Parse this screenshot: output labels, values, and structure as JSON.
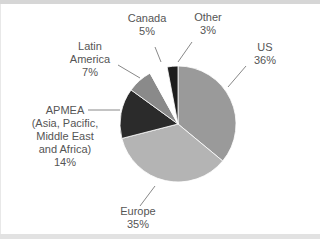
{
  "chart_data": {
    "type": "pie",
    "title": "",
    "labels": [
      "US",
      "Europe",
      "APMEA (Asia, Pacific, Middle East and Africa)",
      "Latin America",
      "Canada",
      "Other"
    ],
    "values": [
      36,
      35,
      14,
      7,
      5,
      3
    ],
    "colors": [
      "#9a9a9a",
      "#b4b4b4",
      "#2b2b2b",
      "#8a8a8a",
      "#ffffff",
      "#1e1e1e"
    ],
    "unit": "%"
  },
  "labels": {
    "us": {
      "name": "US",
      "pct": "36%"
    },
    "europe": {
      "name": "Europe",
      "pct": "35%"
    },
    "apmea": {
      "line1": "APMEA",
      "line2": "(Asia, Pacific,",
      "line3": "Middle East",
      "line4": "and Africa)",
      "pct": "14%"
    },
    "latam": {
      "line1": "Latin",
      "line2": "America",
      "pct": "7%"
    },
    "canada": {
      "name": "Canada",
      "pct": "5%"
    },
    "other": {
      "name": "Other",
      "pct": "3%"
    }
  }
}
